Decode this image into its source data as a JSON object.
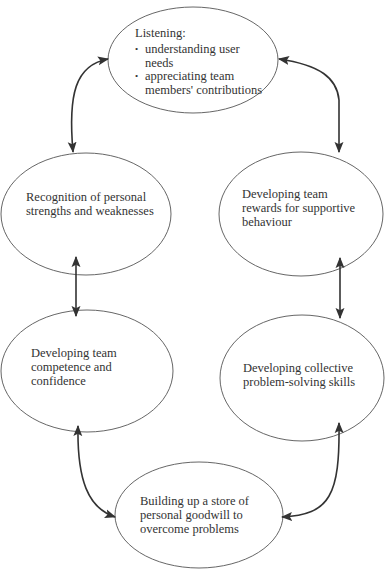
{
  "diagram": {
    "type": "cycle",
    "stroke_color": "#555555",
    "arrow_color": "#333333",
    "nodes": [
      {
        "id": "listening",
        "title": "Listening:",
        "bullets": [
          "understanding user needs",
          "appreciating team members' contributions"
        ],
        "bullet_lines": [
          [
            "understanding user",
            "needs"
          ],
          [
            "appreciating team",
            "members' contributions"
          ]
        ]
      },
      {
        "id": "recognition",
        "lines": [
          "Recognition of personal",
          "strengths and weaknesses"
        ],
        "text": "Recognition of personal strengths and weaknesses"
      },
      {
        "id": "team-rewards",
        "lines": [
          "Developing team",
          "rewards for supportive",
          "behaviour"
        ],
        "text": "Developing team rewards for supportive behaviour"
      },
      {
        "id": "team-competence",
        "lines": [
          "Developing team",
          "competence and",
          "confidence"
        ],
        "text": "Developing team competence and confidence"
      },
      {
        "id": "collective-problem-solving",
        "lines": [
          "Developing collective",
          "problem-solving skills"
        ],
        "text": "Developing collective problem-solving skills"
      },
      {
        "id": "goodwill",
        "lines": [
          "Building up a store of",
          "personal goodwill to",
          "overcome problems"
        ],
        "text": "Building up a store of personal goodwill to overcome problems"
      }
    ],
    "edges": [
      {
        "from": "listening",
        "to": "recognition",
        "bidirectional": true
      },
      {
        "from": "listening",
        "to": "team-rewards",
        "bidirectional": true
      },
      {
        "from": "recognition",
        "to": "team-competence",
        "bidirectional": true
      },
      {
        "from": "team-rewards",
        "to": "collective-problem-solving",
        "bidirectional": true
      },
      {
        "from": "team-competence",
        "to": "goodwill",
        "bidirectional": true
      },
      {
        "from": "collective-problem-solving",
        "to": "goodwill",
        "bidirectional": true
      }
    ]
  }
}
